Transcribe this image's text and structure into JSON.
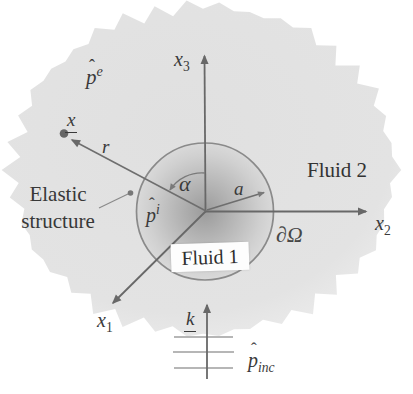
{
  "figure": {
    "labels": {
      "pressure_exterior": {
        "hat": "ˆ",
        "base": "p",
        "sup": "e"
      },
      "pressure_interior": {
        "hat": "ˆ",
        "base": "p",
        "sup": "i"
      },
      "pressure_incident": {
        "hat": "ˆ",
        "base": "p",
        "sub": "inc"
      },
      "field_point": {
        "base": "x"
      },
      "wave_vector": {
        "base": "k"
      },
      "radius_r": "r",
      "angle_alpha": "α",
      "radius_a": "a",
      "axis_x1": {
        "base": "x",
        "sub": "1"
      },
      "axis_x2": {
        "base": "x",
        "sub": "2"
      },
      "axis_x3": {
        "base": "x",
        "sub": "3"
      },
      "boundary": "∂Ω",
      "fluid_inner": "Fluid 1",
      "fluid_outer": "Fluid 2",
      "elastic_line1": "Elastic",
      "elastic_line2": "structure"
    },
    "colors": {
      "background": "#ffffff",
      "domain_fill": "#e2e2e2",
      "circle_center_fill": "#9c9c9c",
      "circle_stroke": "#8a8a8a",
      "line": "#686868",
      "wavefront_line": "#9e9e9e",
      "text": "#3a3a3a",
      "fluid1_box_bg": "#fdfdfd"
    }
  }
}
